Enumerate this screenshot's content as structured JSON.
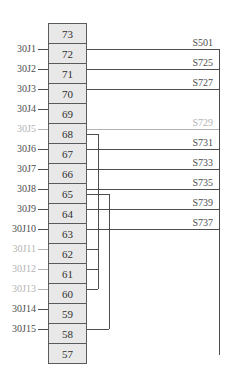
{
  "diagram": {
    "rows": [
      {
        "pin": "73",
        "left": null,
        "left_gray": false,
        "right": null,
        "right_gray": false
      },
      {
        "pin": "72",
        "left": "30J1",
        "left_gray": false,
        "right": "S501",
        "right_gray": false
      },
      {
        "pin": "71",
        "left": "30J2",
        "left_gray": false,
        "right": "S725",
        "right_gray": false
      },
      {
        "pin": "70",
        "left": "30J3",
        "left_gray": false,
        "right": "S727",
        "right_gray": false
      },
      {
        "pin": "69",
        "left": "30J4",
        "left_gray": false,
        "right": null,
        "right_gray": false
      },
      {
        "pin": "68",
        "left": "30J5",
        "left_gray": true,
        "right": "S729",
        "right_gray": true
      },
      {
        "pin": "67",
        "left": "30J6",
        "left_gray": false,
        "right": "S731",
        "right_gray": false
      },
      {
        "pin": "66",
        "left": "30J7",
        "left_gray": false,
        "right": "S733",
        "right_gray": false
      },
      {
        "pin": "65",
        "left": "30J8",
        "left_gray": false,
        "right": "S735",
        "right_gray": false
      },
      {
        "pin": "64",
        "left": "30J9",
        "left_gray": false,
        "right": "S739",
        "right_gray": false
      },
      {
        "pin": "63",
        "left": "30J10",
        "left_gray": false,
        "right": "S737",
        "right_gray": false
      },
      {
        "pin": "62",
        "left": "30J11",
        "left_gray": true,
        "right": null,
        "right_gray": false
      },
      {
        "pin": "61",
        "left": "30J12",
        "left_gray": true,
        "right": null,
        "right_gray": false
      },
      {
        "pin": "60",
        "left": "30J13",
        "left_gray": true,
        "right": null,
        "right_gray": false
      },
      {
        "pin": "59",
        "left": "30J14",
        "left_gray": false,
        "right": null,
        "right_gray": false
      },
      {
        "pin": "58",
        "left": "30J15",
        "left_gray": false,
        "right": null,
        "right_gray": false
      },
      {
        "pin": "57",
        "left": null,
        "left_gray": false,
        "right": null,
        "right_gray": false
      }
    ],
    "internal_nets": [
      {
        "from": "68",
        "taps": [
          "62",
          "61"
        ],
        "to": "60"
      },
      {
        "from": "65",
        "taps": [],
        "to": "58"
      }
    ],
    "colors": {
      "line": "#4d4d4d",
      "inactive_gray": "#b3b3b3",
      "box_fill": "#e8e8e8",
      "box_border": "#5a5a5a",
      "text": "#2e2e2e"
    }
  }
}
